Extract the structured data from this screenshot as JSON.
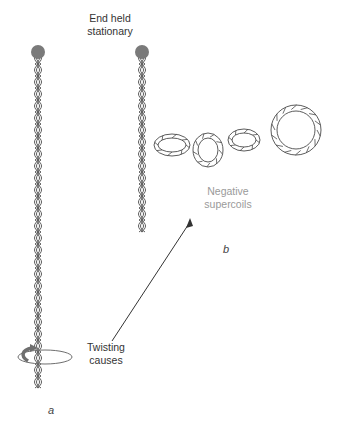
{
  "labels": {
    "end_held": [
      "End held",
      "stationary"
    ],
    "negative": [
      "Negative",
      "supercoils"
    ],
    "twisting": [
      "Twisting",
      "causes"
    ],
    "panel_a": "a",
    "panel_b": "b"
  },
  "colors": {
    "end_cap": "#7a7a7a",
    "rope_stroke": "#4a4a4a",
    "rope_fill": "#ffffff",
    "arrow": "#333333",
    "rotation_arrow": "#6e6e6e",
    "negative_label": "#9a9a9a"
  }
}
